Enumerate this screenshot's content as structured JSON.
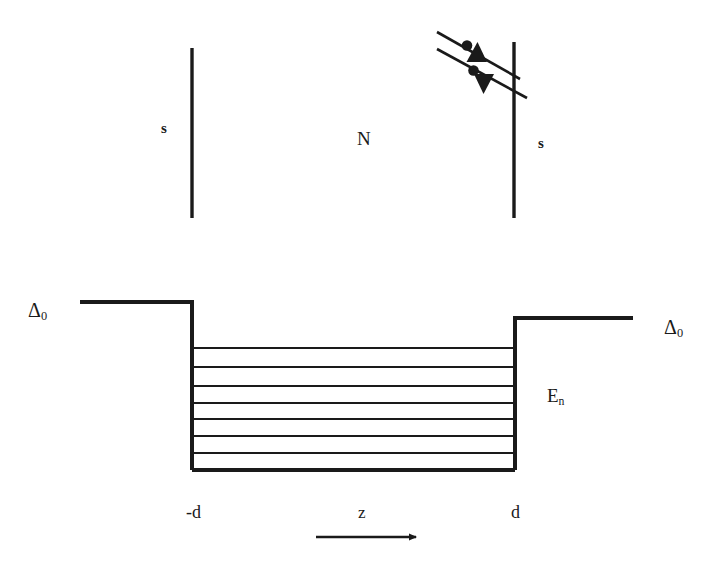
{
  "figure": {
    "top_panel": {
      "left_electrode_label": "s",
      "middle_region_label": "N",
      "right_electrode_label": "s",
      "barriers": [
        {
          "name": "left-barrier",
          "x": 192,
          "y_top": 48,
          "y_bottom": 218
        },
        {
          "name": "right-barrier",
          "x": 514,
          "y_top": 42,
          "y_bottom": 218
        }
      ],
      "trajectories": [
        {
          "name": "upper-trajectory",
          "x1": 437,
          "y1": 32,
          "x2": 520,
          "y2": 79,
          "particle_dot": {
            "cx": 467,
            "cy": 45,
            "r": 5
          },
          "arrowhead": {
            "cx": 477,
            "cy": 55,
            "direction": "up"
          }
        },
        {
          "name": "lower-trajectory",
          "x1": 437,
          "y1": 49,
          "x2": 527,
          "y2": 98,
          "particle_dot": {
            "cx": 473,
            "cy": 72,
            "r": 5
          },
          "arrowhead": {
            "cx": 484,
            "cy": 84,
            "direction": "down"
          }
        }
      ]
    },
    "bottom_panel": {
      "gap_label_left": "Δ0",
      "gap_label_right": "Δ0",
      "gap_symbol": "Δ",
      "gap_subscript": "0",
      "levels_label_symbol": "E",
      "levels_label_subscript": "n",
      "axis_left_tick": "-d",
      "axis_right_tick": "d",
      "axis_name": "z",
      "well": {
        "left_wall_x": 192,
        "right_wall_x": 515,
        "bottom_y": 470,
        "left_plateau_y": 302,
        "right_plateau_y": 318,
        "left_plateau_x_start": 80,
        "right_plateau_x_end": 633
      },
      "energy_levels": {
        "count": 8,
        "y_positions": [
          348,
          367,
          386,
          403,
          419,
          436,
          453,
          470
        ],
        "labels": [
          "E1",
          "E2",
          "E3",
          "E4",
          "E5",
          "E6",
          "E7",
          "E8"
        ]
      },
      "z_arrow": {
        "x1": 316,
        "y1": 537,
        "x2": 418,
        "y2": 537
      }
    },
    "colors": {
      "stroke": "#1a1a1a",
      "background": "#ffffff"
    }
  }
}
